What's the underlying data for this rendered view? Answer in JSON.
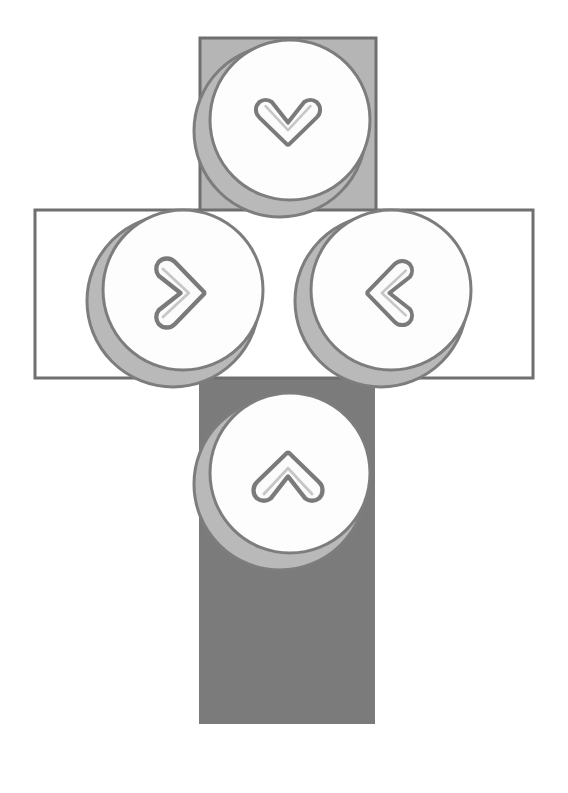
{
  "canvas": {
    "width": 568,
    "height": 793,
    "background": "#ffffff",
    "title": "directional navigation control cluster"
  },
  "palette": {
    "background": "#ffffff",
    "panel_light_fill": "#b5b5b5",
    "panel_dark_fill": "#7b7b7b",
    "panel_outline": "#6f6f6f",
    "panel_empty_fill": "#ffffff",
    "button_ring": "#b9b9b9",
    "button_face": "#fdfdfd",
    "button_outline": "#7d7d7d",
    "chevron_stroke": "#7a7a7a",
    "chevron_fill": "#fbfbfb"
  },
  "panels": [
    {
      "name": "top-panel",
      "label": "down",
      "fill": "#b5b5b5",
      "outlined": true,
      "x": 200,
      "y": 38,
      "width": 176,
      "height": 210
    },
    {
      "name": "middle-panel",
      "label": "horizontal",
      "fill": "#ffffff",
      "outlined": true,
      "x": 35,
      "y": 210,
      "width": 498,
      "height": 168
    },
    {
      "name": "bottom-panel",
      "label": "up",
      "fill": "#7b7b7b",
      "outlined": false,
      "x": 199,
      "y": 230,
      "width": 176,
      "height": 494
    }
  ],
  "buttons": [
    {
      "name": "down-button",
      "icon": "chevron-down-icon",
      "direction": "down",
      "cx": 287,
      "cy": 124,
      "r": 86,
      "ring_offset_x": -7,
      "ring_offset_y": 7,
      "rotation": 90
    },
    {
      "name": "right-button",
      "icon": "chevron-right-icon",
      "direction": "right",
      "cx": 180,
      "cy": 294,
      "r": 86,
      "ring_offset_x": -7,
      "ring_offset_y": 7,
      "rotation": 0
    },
    {
      "name": "left-button",
      "icon": "chevron-left-icon",
      "direction": "left",
      "cx": 388,
      "cy": 294,
      "r": 86,
      "ring_offset_x": -7,
      "ring_offset_y": 7,
      "rotation": 180
    },
    {
      "name": "up-button",
      "icon": "chevron-up-icon",
      "direction": "up",
      "cx": 287,
      "cy": 477,
      "r": 86,
      "ring_offset_x": -7,
      "ring_offset_y": 7,
      "rotation": 270
    }
  ],
  "labels": {
    "down_button": "Down",
    "up_button": "Up",
    "left_button": "Left",
    "right_button": "Right",
    "top_panel": "Top panel",
    "middle_panel": "Middle panel",
    "bottom_panel": "Bottom panel"
  }
}
